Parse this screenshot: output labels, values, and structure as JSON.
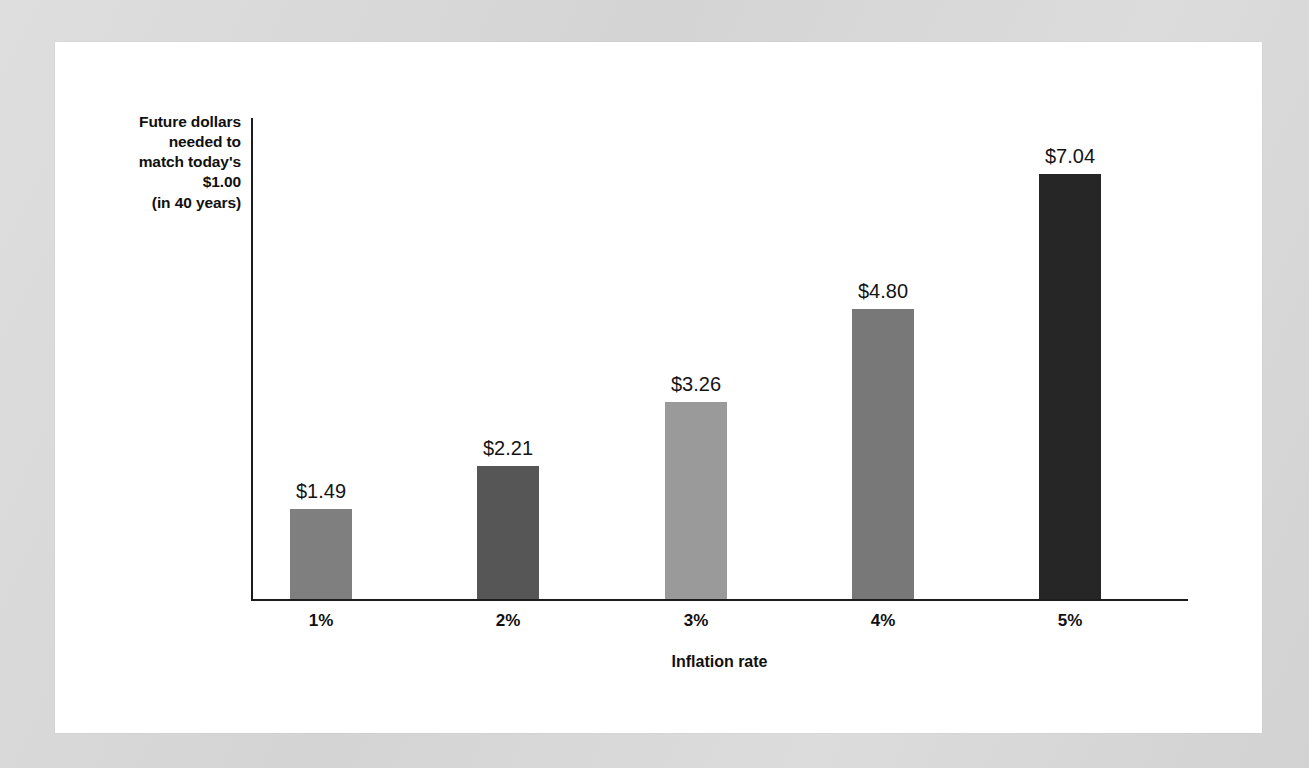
{
  "figure": {
    "background_color": "#d7d7d7",
    "panel_color": "#ffffff"
  },
  "chart_data": {
    "type": "bar",
    "title": "",
    "subtitle": "",
    "xlabel": "Inflation rate",
    "ylabel": "Future dollars needed to match today's $1.00 (in 40 years)",
    "ylabel_lines": [
      "Future dollars",
      "needed to",
      "match today's",
      "$1.00",
      "(in 40 years)"
    ],
    "categories": [
      "1%",
      "2%",
      "3%",
      "4%",
      "5%"
    ],
    "values": [
      1.49,
      2.21,
      3.26,
      4.8,
      7.04
    ],
    "value_labels": [
      "$1.49",
      "$2.21",
      "$3.26",
      "$4.80",
      "$7.04"
    ],
    "bar_colors": [
      "#7f7f7f",
      "#565656",
      "#9a9a9a",
      "#787878",
      "#262626"
    ],
    "ylim": [
      0,
      8.0
    ],
    "grid": false,
    "legend": null,
    "axis_color": "#1c1c1c",
    "y_tick_labels": [],
    "x_tick_labels": [
      "1%",
      "2%",
      "3%",
      "4%",
      "5%"
    ]
  }
}
